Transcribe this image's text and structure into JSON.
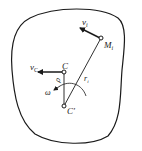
{
  "diagram": {
    "type": "rigid-body-kinematics",
    "labels": {
      "v_i": "v",
      "v_i_sub": "i",
      "M_i": "M",
      "M_i_sub": "i",
      "v_C": "v",
      "v_C_sub": "C",
      "C": "C",
      "r_i": "r",
      "r_i_sub": "i",
      "rho": "ρ",
      "omega": "ω",
      "C_prime": "C′"
    },
    "colors": {
      "stroke": "#1a1a1a",
      "background": "#ffffff"
    }
  }
}
